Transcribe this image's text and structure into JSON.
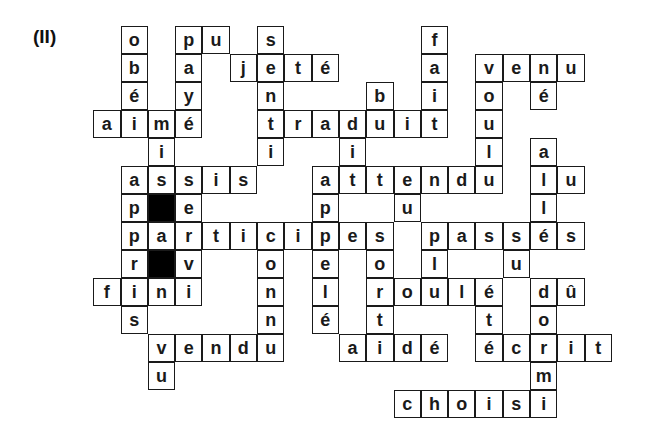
{
  "puzzle": {
    "label": "(II)",
    "cell_width": 27.3,
    "cell_height": 28,
    "cols": 19,
    "rows": 14,
    "cells": [
      {
        "r": 0,
        "c": 1,
        "ch": "o"
      },
      {
        "r": 0,
        "c": 3,
        "ch": "p"
      },
      {
        "r": 0,
        "c": 4,
        "ch": "u"
      },
      {
        "r": 0,
        "c": 6,
        "ch": "s"
      },
      {
        "r": 0,
        "c": 12,
        "ch": "f"
      },
      {
        "r": 1,
        "c": 1,
        "ch": "b"
      },
      {
        "r": 1,
        "c": 3,
        "ch": "a"
      },
      {
        "r": 1,
        "c": 5,
        "ch": "j"
      },
      {
        "r": 1,
        "c": 6,
        "ch": "e"
      },
      {
        "r": 1,
        "c": 7,
        "ch": "t"
      },
      {
        "r": 1,
        "c": 8,
        "ch": "é"
      },
      {
        "r": 1,
        "c": 12,
        "ch": "a"
      },
      {
        "r": 1,
        "c": 14,
        "ch": "v"
      },
      {
        "r": 1,
        "c": 15,
        "ch": "e"
      },
      {
        "r": 1,
        "c": 16,
        "ch": "n"
      },
      {
        "r": 1,
        "c": 17,
        "ch": "u"
      },
      {
        "r": 2,
        "c": 1,
        "ch": "é"
      },
      {
        "r": 2,
        "c": 3,
        "ch": "y"
      },
      {
        "r": 2,
        "c": 6,
        "ch": "n"
      },
      {
        "r": 2,
        "c": 10,
        "ch": "b"
      },
      {
        "r": 2,
        "c": 12,
        "ch": "i"
      },
      {
        "r": 2,
        "c": 14,
        "ch": "o"
      },
      {
        "r": 2,
        "c": 16,
        "ch": "é"
      },
      {
        "r": 3,
        "c": 0,
        "ch": "a"
      },
      {
        "r": 3,
        "c": 1,
        "ch": "i"
      },
      {
        "r": 3,
        "c": 2,
        "ch": "m"
      },
      {
        "r": 3,
        "c": 3,
        "ch": "é"
      },
      {
        "r": 3,
        "c": 6,
        "ch": "t"
      },
      {
        "r": 3,
        "c": 7,
        "ch": "r"
      },
      {
        "r": 3,
        "c": 8,
        "ch": "a"
      },
      {
        "r": 3,
        "c": 9,
        "ch": "d"
      },
      {
        "r": 3,
        "c": 10,
        "ch": "u"
      },
      {
        "r": 3,
        "c": 11,
        "ch": "i"
      },
      {
        "r": 3,
        "c": 12,
        "ch": "t"
      },
      {
        "r": 3,
        "c": 14,
        "ch": "u"
      },
      {
        "r": 4,
        "c": 2,
        "ch": "i"
      },
      {
        "r": 4,
        "c": 6,
        "ch": "i"
      },
      {
        "r": 4,
        "c": 9,
        "ch": "i"
      },
      {
        "r": 4,
        "c": 14,
        "ch": "l"
      },
      {
        "r": 4,
        "c": 16,
        "ch": "a"
      },
      {
        "r": 5,
        "c": 1,
        "ch": "a"
      },
      {
        "r": 5,
        "c": 2,
        "ch": "s"
      },
      {
        "r": 5,
        "c": 3,
        "ch": "s"
      },
      {
        "r": 5,
        "c": 4,
        "ch": "i"
      },
      {
        "r": 5,
        "c": 5,
        "ch": "s"
      },
      {
        "r": 5,
        "c": 8,
        "ch": "a"
      },
      {
        "r": 5,
        "c": 9,
        "ch": "t"
      },
      {
        "r": 5,
        "c": 10,
        "ch": "t"
      },
      {
        "r": 5,
        "c": 11,
        "ch": "e"
      },
      {
        "r": 5,
        "c": 12,
        "ch": "n"
      },
      {
        "r": 5,
        "c": 13,
        "ch": "d"
      },
      {
        "r": 5,
        "c": 14,
        "ch": "u"
      },
      {
        "r": 5,
        "c": 16,
        "ch": "l"
      },
      {
        "r": 5,
        "c": 17,
        "ch": "u"
      },
      {
        "r": 6,
        "c": 1,
        "ch": "p"
      },
      {
        "r": 6,
        "c": 2,
        "ch": "",
        "black": true
      },
      {
        "r": 6,
        "c": 3,
        "ch": "e"
      },
      {
        "r": 6,
        "c": 8,
        "ch": "p"
      },
      {
        "r": 6,
        "c": 11,
        "ch": "u"
      },
      {
        "r": 6,
        "c": 16,
        "ch": "l"
      },
      {
        "r": 7,
        "c": 1,
        "ch": "p"
      },
      {
        "r": 7,
        "c": 2,
        "ch": "a"
      },
      {
        "r": 7,
        "c": 3,
        "ch": "r"
      },
      {
        "r": 7,
        "c": 4,
        "ch": "t"
      },
      {
        "r": 7,
        "c": 5,
        "ch": "i"
      },
      {
        "r": 7,
        "c": 6,
        "ch": "c"
      },
      {
        "r": 7,
        "c": 7,
        "ch": "i"
      },
      {
        "r": 7,
        "c": 8,
        "ch": "p"
      },
      {
        "r": 7,
        "c": 9,
        "ch": "e"
      },
      {
        "r": 7,
        "c": 10,
        "ch": "s"
      },
      {
        "r": 7,
        "c": 12,
        "ch": "p"
      },
      {
        "r": 7,
        "c": 13,
        "ch": "a"
      },
      {
        "r": 7,
        "c": 14,
        "ch": "s"
      },
      {
        "r": 7,
        "c": 15,
        "ch": "s"
      },
      {
        "r": 7,
        "c": 16,
        "ch": "é"
      },
      {
        "r": 7,
        "c": 17,
        "ch": "s"
      },
      {
        "r": 8,
        "c": 1,
        "ch": "r"
      },
      {
        "r": 8,
        "c": 2,
        "ch": "",
        "black": true
      },
      {
        "r": 8,
        "c": 3,
        "ch": "v"
      },
      {
        "r": 8,
        "c": 6,
        "ch": "o"
      },
      {
        "r": 8,
        "c": 8,
        "ch": "e"
      },
      {
        "r": 8,
        "c": 10,
        "ch": "o"
      },
      {
        "r": 8,
        "c": 12,
        "ch": "l"
      },
      {
        "r": 8,
        "c": 15,
        "ch": "u"
      },
      {
        "r": 9,
        "c": 0,
        "ch": "f"
      },
      {
        "r": 9,
        "c": 1,
        "ch": "i"
      },
      {
        "r": 9,
        "c": 2,
        "ch": "n"
      },
      {
        "r": 9,
        "c": 3,
        "ch": "i"
      },
      {
        "r": 9,
        "c": 6,
        "ch": "n"
      },
      {
        "r": 9,
        "c": 8,
        "ch": "l"
      },
      {
        "r": 9,
        "c": 10,
        "ch": "r"
      },
      {
        "r": 9,
        "c": 11,
        "ch": "o"
      },
      {
        "r": 9,
        "c": 12,
        "ch": "u"
      },
      {
        "r": 9,
        "c": 13,
        "ch": "l"
      },
      {
        "r": 9,
        "c": 14,
        "ch": "é"
      },
      {
        "r": 9,
        "c": 16,
        "ch": "d"
      },
      {
        "r": 9,
        "c": 17,
        "ch": "û"
      },
      {
        "r": 10,
        "c": 1,
        "ch": "s"
      },
      {
        "r": 10,
        "c": 6,
        "ch": "n"
      },
      {
        "r": 10,
        "c": 8,
        "ch": "é"
      },
      {
        "r": 10,
        "c": 10,
        "ch": "t"
      },
      {
        "r": 10,
        "c": 14,
        "ch": "t"
      },
      {
        "r": 10,
        "c": 16,
        "ch": "o"
      },
      {
        "r": 11,
        "c": 2,
        "ch": "v"
      },
      {
        "r": 11,
        "c": 3,
        "ch": "e"
      },
      {
        "r": 11,
        "c": 4,
        "ch": "n"
      },
      {
        "r": 11,
        "c": 5,
        "ch": "d"
      },
      {
        "r": 11,
        "c": 6,
        "ch": "u"
      },
      {
        "r": 11,
        "c": 9,
        "ch": "a"
      },
      {
        "r": 11,
        "c": 10,
        "ch": "i"
      },
      {
        "r": 11,
        "c": 11,
        "ch": "d"
      },
      {
        "r": 11,
        "c": 12,
        "ch": "é"
      },
      {
        "r": 11,
        "c": 14,
        "ch": "é"
      },
      {
        "r": 11,
        "c": 15,
        "ch": "c"
      },
      {
        "r": 11,
        "c": 16,
        "ch": "r"
      },
      {
        "r": 11,
        "c": 17,
        "ch": "i"
      },
      {
        "r": 11,
        "c": 18,
        "ch": "t"
      },
      {
        "r": 12,
        "c": 2,
        "ch": "u"
      },
      {
        "r": 12,
        "c": 16,
        "ch": "m"
      },
      {
        "r": 13,
        "c": 11,
        "ch": "c"
      },
      {
        "r": 13,
        "c": 12,
        "ch": "h"
      },
      {
        "r": 13,
        "c": 13,
        "ch": "o"
      },
      {
        "r": 13,
        "c": 14,
        "ch": "i"
      },
      {
        "r": 13,
        "c": 15,
        "ch": "s"
      },
      {
        "r": 13,
        "c": 16,
        "ch": "i"
      }
    ],
    "words": {
      "across": [
        "pu",
        "jeté",
        "venu",
        "aimé",
        "traduit",
        "assis",
        "attendu",
        "lu",
        "participes",
        "passés",
        "fini",
        "roulé",
        "dû",
        "vendu",
        "aidé",
        "écrit",
        "choisi"
      ],
      "down": [
        "obéi",
        "payé",
        "senti",
        "fait",
        "voulu",
        "né",
        "bu",
        "mis",
        "apprise",
        "connu",
        "pelé",
        "sorti",
        "allé",
        "dormi",
        "vu",
        "eu",
        "su",
        "vécu"
      ]
    }
  }
}
